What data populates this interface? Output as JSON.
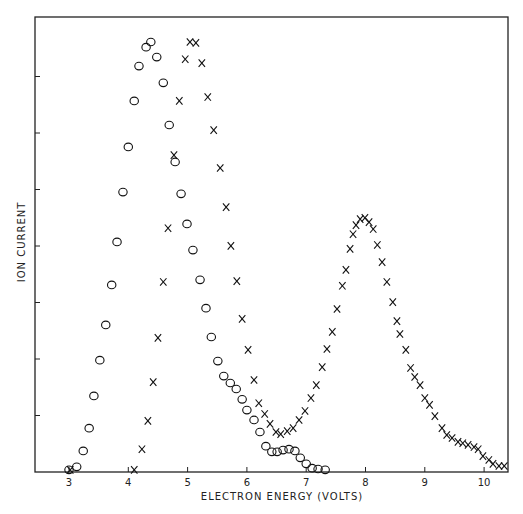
{
  "chart_data": {
    "type": "scatter",
    "title": "",
    "xlabel": "ELECTRON ENERGY (VOLTS)",
    "ylabel": "ION CURRENT",
    "xlim": [
      2.4,
      10.4
    ],
    "ylim": [
      0,
      106
    ],
    "x_ticks": [
      3,
      4,
      5,
      6,
      7,
      8,
      9,
      10
    ],
    "y_ticks_unlabeled": 7,
    "grid": false,
    "legend": null,
    "y_units": "arbitrary (normalized, peak = 100)",
    "series": [
      {
        "name": "circles",
        "marker": "o",
        "points": [
          [
            3.0,
            0.5
          ],
          [
            3.13,
            1.2
          ],
          [
            3.24,
            4.9
          ],
          [
            3.34,
            10.2
          ],
          [
            3.42,
            17.7
          ],
          [
            3.52,
            26.0
          ],
          [
            3.62,
            34.2
          ],
          [
            3.72,
            43.5
          ],
          [
            3.81,
            53.5
          ],
          [
            3.91,
            65.1
          ],
          [
            4.0,
            75.6
          ],
          [
            4.1,
            86.3
          ],
          [
            4.18,
            94.4
          ],
          [
            4.3,
            98.8
          ],
          [
            4.38,
            100.0
          ],
          [
            4.48,
            96.5
          ],
          [
            4.59,
            90.5
          ],
          [
            4.69,
            80.7
          ],
          [
            4.79,
            72.1
          ],
          [
            4.89,
            64.7
          ],
          [
            4.99,
            57.7
          ],
          [
            5.09,
            51.6
          ],
          [
            5.21,
            44.7
          ],
          [
            5.31,
            38.1
          ],
          [
            5.4,
            31.4
          ],
          [
            5.51,
            25.8
          ],
          [
            5.61,
            22.3
          ],
          [
            5.72,
            20.7
          ],
          [
            5.82,
            19.3
          ],
          [
            5.92,
            16.9
          ],
          [
            6.0,
            14.4
          ],
          [
            6.12,
            12.1
          ],
          [
            6.22,
            9.3
          ],
          [
            6.32,
            6.0
          ],
          [
            6.42,
            4.7
          ],
          [
            6.51,
            4.7
          ],
          [
            6.61,
            5.1
          ],
          [
            6.71,
            5.3
          ],
          [
            6.81,
            4.9
          ],
          [
            6.9,
            3.3
          ],
          [
            7.0,
            1.9
          ],
          [
            7.1,
            0.9
          ],
          [
            7.2,
            0.7
          ],
          [
            7.32,
            0.5
          ]
        ]
      },
      {
        "name": "crosses",
        "marker": "x",
        "points": [
          [
            3.02,
            0.5
          ],
          [
            4.1,
            0.5
          ],
          [
            4.23,
            5.3
          ],
          [
            4.33,
            11.9
          ],
          [
            4.42,
            20.9
          ],
          [
            4.5,
            31.2
          ],
          [
            4.59,
            44.2
          ],
          [
            4.67,
            56.7
          ],
          [
            4.77,
            73.7
          ],
          [
            4.86,
            86.3
          ],
          [
            4.96,
            96.0
          ],
          [
            5.04,
            100.0
          ],
          [
            5.14,
            99.8
          ],
          [
            5.24,
            95.1
          ],
          [
            5.34,
            87.2
          ],
          [
            5.44,
            79.5
          ],
          [
            5.55,
            70.7
          ],
          [
            5.65,
            61.6
          ],
          [
            5.73,
            52.6
          ],
          [
            5.83,
            44.4
          ],
          [
            5.92,
            35.6
          ],
          [
            6.02,
            28.4
          ],
          [
            6.12,
            21.4
          ],
          [
            6.2,
            16.0
          ],
          [
            6.3,
            13.5
          ],
          [
            6.39,
            11.2
          ],
          [
            6.49,
            9.3
          ],
          [
            6.57,
            8.8
          ],
          [
            6.68,
            9.5
          ],
          [
            6.78,
            10.2
          ],
          [
            6.88,
            12.1
          ],
          [
            6.98,
            14.2
          ],
          [
            7.08,
            17.2
          ],
          [
            7.17,
            20.2
          ],
          [
            7.27,
            24.4
          ],
          [
            7.35,
            28.6
          ],
          [
            7.44,
            32.6
          ],
          [
            7.52,
            37.9
          ],
          [
            7.61,
            43.3
          ],
          [
            7.67,
            47.0
          ],
          [
            7.74,
            51.9
          ],
          [
            7.79,
            55.3
          ],
          [
            7.84,
            57.4
          ],
          [
            7.91,
            58.8
          ],
          [
            7.99,
            59.1
          ],
          [
            8.06,
            58.1
          ],
          [
            8.13,
            56.5
          ],
          [
            8.2,
            52.8
          ],
          [
            8.28,
            48.8
          ],
          [
            8.36,
            44.2
          ],
          [
            8.46,
            39.5
          ],
          [
            8.53,
            35.1
          ],
          [
            8.58,
            32.1
          ],
          [
            8.68,
            28.4
          ],
          [
            8.76,
            24.2
          ],
          [
            8.83,
            22.1
          ],
          [
            8.92,
            20.2
          ],
          [
            9.0,
            17.2
          ],
          [
            9.08,
            15.6
          ],
          [
            9.17,
            13.0
          ],
          [
            9.29,
            10.2
          ],
          [
            9.37,
            8.6
          ],
          [
            9.46,
            7.9
          ],
          [
            9.56,
            7.0
          ],
          [
            9.64,
            6.7
          ],
          [
            9.73,
            6.3
          ],
          [
            9.83,
            5.8
          ],
          [
            9.9,
            5.3
          ],
          [
            9.98,
            3.7
          ],
          [
            10.08,
            2.8
          ],
          [
            10.15,
            1.9
          ],
          [
            10.25,
            1.4
          ],
          [
            10.34,
            1.4
          ]
        ]
      }
    ]
  }
}
